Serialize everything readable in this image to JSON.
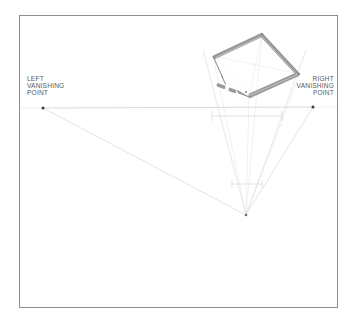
{
  "document": {
    "kind": "two-point-perspective-setup-drawing",
    "page_background": "#ffffff",
    "border_color": "#8d8d91"
  },
  "labels": {
    "left_vanishing_point": "LEFT\nVANISHING\nPOINT",
    "right_vanishing_point": "RIGHT\nVANISHING\nPOINT"
  },
  "colors": {
    "wall": "#8a8a8e",
    "wall_fill": "#9a9a9e",
    "horizon_line": "#c9c9cd",
    "projection_line": "#dedee2",
    "construction_line": "#ebebee",
    "measure_line": "#d2d2d6",
    "point_marker": "#4a4a4e",
    "border": "#8d8d91",
    "label_text": "#58585c"
  },
  "geometry": {
    "frame": {
      "x": 19,
      "y": 15,
      "width": 319,
      "height": 293
    },
    "horizon_y": 108,
    "left_vp": {
      "x": 43,
      "y": 108
    },
    "right_vp": {
      "x": 313,
      "y": 107
    },
    "station_point": {
      "x": 246,
      "y": 215
    },
    "plan_corners": {
      "top": {
        "x": 262,
        "y": 33
      },
      "right": {
        "x": 300,
        "y": 74
      },
      "bottom": {
        "x": 249,
        "y": 97
      },
      "left": {
        "x": 213,
        "y": 56
      }
    },
    "wall_thickness": 3.2,
    "upper_measure_line": {
      "y": 116,
      "x1": 212,
      "x2": 282
    },
    "lower_measure_line": {
      "y": 184,
      "x1": 232,
      "x2": 262
    },
    "door_gaps": [
      {
        "wall": "bottom",
        "t_start": 0.14,
        "t_end": 0.3
      },
      {
        "wall": "bottom",
        "t_start": 0.4,
        "t_end": 0.62
      },
      {
        "wall": "left",
        "t_start": 0.72,
        "t_end": 0.92
      }
    ]
  }
}
